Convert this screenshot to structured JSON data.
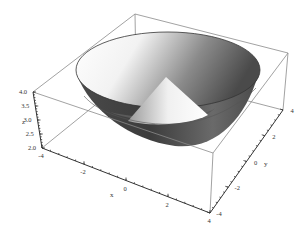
{
  "chart_data": {
    "type": "surface3d",
    "title": "",
    "surface": {
      "bowl": {
        "shape": "inverted frustum",
        "z_min": 2.0,
        "z_max": 4.0,
        "rim_radius": 4.0,
        "base_radius": 2.0
      },
      "inner_cone": {
        "shape": "cone",
        "apex_z": 4.0,
        "base_z": 2.0,
        "base_radius": 2.0
      }
    },
    "axes": {
      "x": {
        "label": "x",
        "range": [
          -4,
          4
        ],
        "ticks": [
          "-4",
          "-2",
          "0",
          "2",
          "4"
        ]
      },
      "y": {
        "label": "y",
        "range": [
          -4,
          4
        ],
        "ticks": [
          "-4",
          "-2",
          "0",
          "2",
          "4"
        ]
      },
      "z": {
        "label": "z",
        "range": [
          2.0,
          4.0
        ],
        "ticks": [
          "2.0",
          "2.5",
          "3.0",
          "3.5",
          "4.0"
        ]
      }
    },
    "box": true,
    "grid": false,
    "legend": null,
    "colors": {
      "surface_light": "#ffffff",
      "surface_dark": "#3a3a3a",
      "box_line": "#8a8a8a",
      "axis_line": "#333333"
    }
  }
}
